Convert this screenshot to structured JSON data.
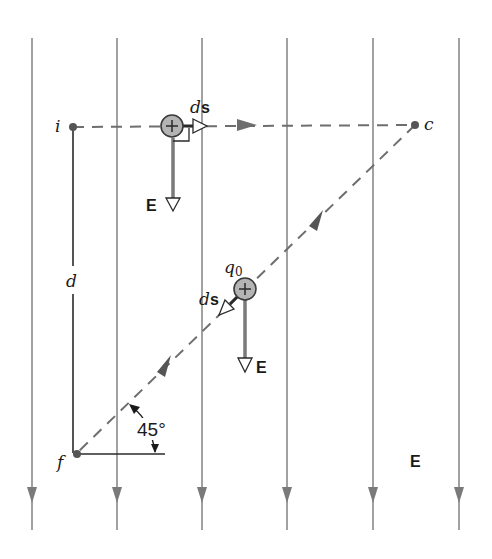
{
  "diagram": {
    "type": "physics-field-path",
    "colors": {
      "field_line": "#8a8a8a",
      "path_dash": "#6e6e6e",
      "charge_fill": "#b4b4b4",
      "charge_stroke": "#3a3a3a",
      "vector_E": "#7a7a7a",
      "text": "#1a1a1a"
    },
    "field_lines": {
      "count": 6,
      "direction": "down",
      "x_positions": [
        32,
        117,
        202,
        287,
        373,
        459
      ]
    },
    "points": {
      "i": {
        "label": "i"
      },
      "c": {
        "label": "c"
      },
      "f": {
        "label": "f"
      }
    },
    "labels": {
      "distance": "d",
      "field_label_bottom": "E",
      "angle": "45°",
      "charge_name": "q",
      "charge_subscript": "0"
    },
    "charges": [
      {
        "id": "charge-on-ic",
        "sign": "+",
        "ds_label_italic": "d",
        "ds_label_bold": "s",
        "field_vector_label": "E"
      },
      {
        "id": "charge-on-cf",
        "sign": "+",
        "ds_label_italic": "d",
        "ds_label_bold": "s",
        "field_vector_label": "E"
      }
    ]
  }
}
